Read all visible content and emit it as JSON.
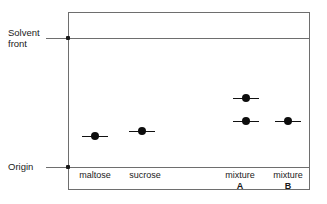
{
  "figure": {
    "type": "paper-chromatogram",
    "width": 327,
    "height": 204
  },
  "labels": {
    "solvent_front": "Solvent\nfront",
    "origin": "Origin"
  },
  "plate": {
    "left": 68,
    "top": 12,
    "width": 242,
    "height": 178,
    "border_color": "#6e6e6e",
    "solvent_front_y": 38,
    "origin_y": 167
  },
  "lanes": [
    {
      "id": "maltose",
      "name": "maltose",
      "sub": "",
      "x": 95,
      "caption_x": 95,
      "spots": [
        {
          "y": 136,
          "rf": 0.24
        }
      ]
    },
    {
      "id": "sucrose",
      "name": "sucrose",
      "sub": "",
      "x": 142,
      "caption_x": 145,
      "spots": [
        {
          "y": 131,
          "rf": 0.28
        }
      ]
    },
    {
      "id": "mixture-a",
      "name": "mixture",
      "sub": "A",
      "x": 246,
      "caption_x": 240,
      "spots": [
        {
          "y": 98,
          "rf": 0.53
        },
        {
          "y": 121,
          "rf": 0.36
        }
      ]
    },
    {
      "id": "mixture-b",
      "name": "mixture",
      "sub": "B",
      "x": 288,
      "caption_x": 288,
      "spots": [
        {
          "y": 121,
          "rf": 0.36
        }
      ]
    }
  ],
  "chart_data": {
    "type": "scatter",
    "title": "",
    "xlabel": "",
    "ylabel": "",
    "axis_references": {
      "origin_y_px": 167,
      "solvent_front_y_px": 38,
      "travel_distance_px": 129
    },
    "categories": [
      "maltose",
      "sucrose",
      "mixture A",
      "mixture B"
    ],
    "series": [
      {
        "name": "spot Rf values",
        "points": [
          {
            "lane": "maltose",
            "lane_x_px": 95,
            "y_px": 136,
            "rf": 0.24
          },
          {
            "lane": "sucrose",
            "lane_x_px": 142,
            "y_px": 131,
            "rf": 0.28
          },
          {
            "lane": "mixture A",
            "lane_x_px": 246,
            "y_px": 98,
            "rf": 0.53
          },
          {
            "lane": "mixture A",
            "lane_x_px": 246,
            "y_px": 121,
            "rf": 0.36
          },
          {
            "lane": "mixture B",
            "lane_x_px": 288,
            "y_px": 121,
            "rf": 0.36
          }
        ]
      }
    ],
    "annotations": [
      "Solvent front",
      "Origin"
    ],
    "grid": false,
    "legend": "none"
  },
  "colors": {
    "spot": "#0d0d0d",
    "line": "#6e6e6e",
    "text": "#1a1a1a",
    "background": "#ffffff"
  }
}
